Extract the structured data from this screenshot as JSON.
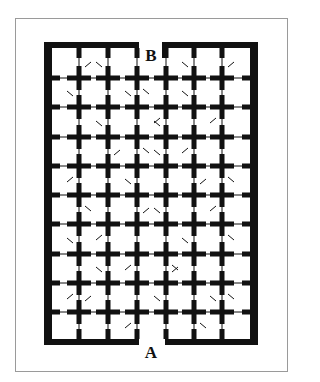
{
  "diagram": {
    "type": "maze",
    "colors": {
      "wall": "#111111",
      "frame": "#9a9a9a",
      "background": "#ffffff"
    },
    "labels": {
      "entrance": {
        "text": "A",
        "x": 151,
        "y": 352
      },
      "exit": {
        "text": "B",
        "x": 151,
        "y": 55
      }
    },
    "outer_wall": {
      "left": 44,
      "right": 258,
      "top": 42,
      "bottom": 345,
      "side_thickness": 8,
      "top_thickness": 6,
      "gap_top": [
        139,
        162
      ],
      "gap_bottom": [
        139,
        165
      ]
    },
    "grid": {
      "cols_x": [
        79,
        108,
        137,
        166,
        194,
        222
      ],
      "rows_y": [
        78,
        107,
        137,
        166,
        195,
        224,
        254,
        283,
        312
      ],
      "arm": 12,
      "arm_thickness": 5
    },
    "doors": [
      [
        0,
        0,
        "ne"
      ],
      [
        1,
        0,
        "nw"
      ],
      [
        5,
        0,
        "ne"
      ],
      [
        2,
        0,
        "se"
      ],
      [
        4,
        0,
        "nw"
      ],
      [
        0,
        1,
        "nw"
      ],
      [
        2,
        1,
        "nw"
      ],
      [
        3,
        1,
        "sw"
      ],
      [
        4,
        1,
        "nw"
      ],
      [
        5,
        1,
        "sw"
      ],
      [
        1,
        2,
        "nw"
      ],
      [
        2,
        2,
        "se"
      ],
      [
        3,
        2,
        "nw"
      ],
      [
        4,
        2,
        "sw"
      ],
      [
        0,
        3,
        "sw"
      ],
      [
        1,
        3,
        "ne"
      ],
      [
        3,
        3,
        "nw"
      ],
      [
        5,
        3,
        "se"
      ],
      [
        0,
        4,
        "se"
      ],
      [
        2,
        4,
        "nw"
      ],
      [
        4,
        4,
        "ne"
      ],
      [
        5,
        4,
        "sw"
      ],
      [
        1,
        5,
        "sw"
      ],
      [
        2,
        5,
        "ne"
      ],
      [
        3,
        5,
        "nw"
      ],
      [
        5,
        5,
        "se"
      ],
      [
        0,
        6,
        "nw"
      ],
      [
        2,
        6,
        "sw"
      ],
      [
        3,
        6,
        "se"
      ],
      [
        4,
        6,
        "nw"
      ],
      [
        0,
        7,
        "sw"
      ],
      [
        1,
        7,
        "nw"
      ],
      [
        3,
        7,
        "ne"
      ],
      [
        5,
        7,
        "se"
      ],
      [
        0,
        8,
        "ne"
      ],
      [
        2,
        8,
        "sw"
      ],
      [
        3,
        8,
        "nw"
      ],
      [
        4,
        8,
        "se"
      ],
      [
        5,
        8,
        "nw"
      ]
    ]
  }
}
